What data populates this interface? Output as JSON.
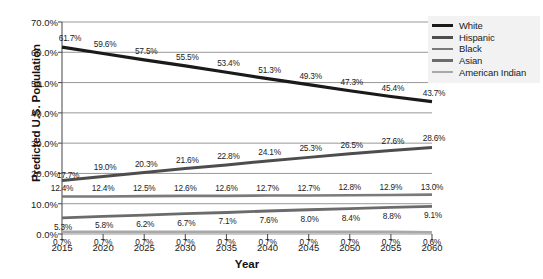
{
  "chart_data": {
    "type": "line",
    "title": "",
    "xlabel": "Year",
    "ylabel": "Predicted U.S. Population",
    "categories": [
      2015,
      2020,
      2025,
      2030,
      2035,
      2040,
      2045,
      2050,
      2055,
      2060
    ],
    "x_tick_labels": [
      "2015",
      "2020",
      "2025",
      "2030",
      "2035",
      "2040",
      "2045",
      "2050",
      "2055",
      "2060"
    ],
    "y_tick_labels": [
      "0.0%",
      "10.0%",
      "20.0%",
      "30.0%",
      "40.0%",
      "50.0%",
      "60.0%",
      "70.0%"
    ],
    "y_tick_values": [
      0,
      10,
      20,
      30,
      40,
      50,
      60,
      70
    ],
    "ylim": [
      0,
      70
    ],
    "grid": "horizontal",
    "legend_position": "right",
    "series": [
      {
        "name": "White",
        "color": "#1a1a1a",
        "width": 3.2,
        "values": [
          61.7,
          59.6,
          57.5,
          55.5,
          53.4,
          51.3,
          49.3,
          47.3,
          45.4,
          43.7
        ],
        "labels": [
          "61.7%",
          "59.6%",
          "57.5%",
          "55.5%",
          "53.4%",
          "51.3%",
          "49.3%",
          "47.3%",
          "45.4%",
          "43.7%"
        ]
      },
      {
        "name": "Hispanic",
        "color": "#4d4d4d",
        "width": 3.0,
        "values": [
          17.7,
          19.0,
          20.3,
          21.6,
          22.8,
          24.1,
          25.3,
          26.5,
          27.6,
          28.6
        ],
        "labels": [
          "17.7%",
          "19.0%",
          "20.3%",
          "21.6%",
          "22.8%",
          "24.1%",
          "25.3%",
          "26.5%",
          "27.6%",
          "28.6%"
        ]
      },
      {
        "name": "Black",
        "color": "#7a7a7a",
        "width": 2.6,
        "values": [
          12.4,
          12.4,
          12.5,
          12.6,
          12.6,
          12.7,
          12.7,
          12.8,
          12.9,
          13.0
        ],
        "labels": [
          "12.4%",
          "12.4%",
          "12.5%",
          "12.6%",
          "12.6%",
          "12.7%",
          "12.7%",
          "12.8%",
          "12.9%",
          "13.0%"
        ]
      },
      {
        "name": "Asian",
        "color": "#6b6b6b",
        "width": 2.8,
        "values": [
          5.3,
          5.8,
          6.2,
          6.7,
          7.1,
          7.6,
          8.0,
          8.4,
          8.8,
          9.1
        ],
        "labels": [
          "5.3%",
          "5.8%",
          "6.2%",
          "6.7%",
          "7.1%",
          "7.6%",
          "8.0%",
          "8.4%",
          "8.8%",
          "9.1%"
        ]
      },
      {
        "name": "American Indian",
        "color": "#a8a8a8",
        "width": 2.6,
        "values": [
          0.7,
          0.7,
          0.7,
          0.7,
          0.7,
          0.7,
          0.7,
          0.7,
          0.7,
          0.6
        ],
        "labels": [
          "0.7%",
          "0.7%",
          "0.7%",
          "0.7%",
          "0.7%",
          "0.7%",
          "0.7%",
          "0.7%",
          "0.7%",
          "0.6%"
        ]
      }
    ]
  },
  "legend": {
    "items": [
      {
        "label": "White"
      },
      {
        "label": "Hispanic"
      },
      {
        "label": "Black"
      },
      {
        "label": "Asian"
      },
      {
        "label": "American Indian"
      }
    ]
  },
  "colors": {
    "grid": "#8c8c8c",
    "axis": "#555555",
    "legend_background": "#f2f2f2",
    "text": "#1a1a1a"
  }
}
